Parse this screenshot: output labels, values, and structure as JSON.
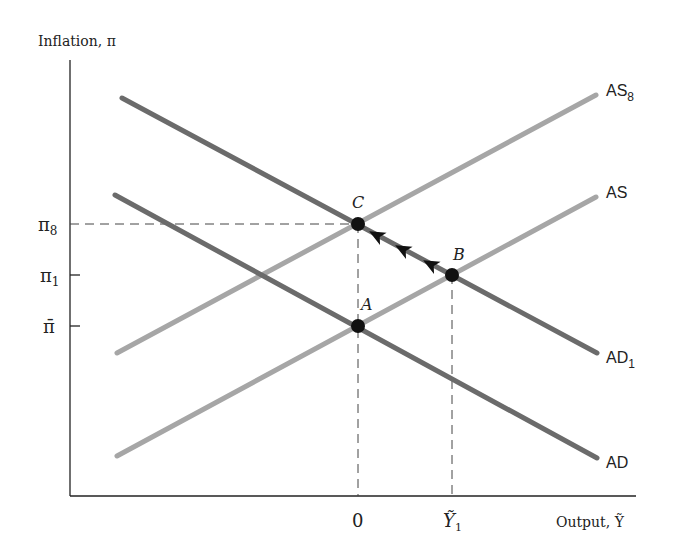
{
  "diagram": {
    "type": "AS-AD model",
    "y_axis": {
      "label": "Inflation, π"
    },
    "x_axis": {
      "label": "Output, Ỹ"
    },
    "y_ticks": [
      {
        "label": "π",
        "sub": "8",
        "y": 224
      },
      {
        "label": "π",
        "sub": "1",
        "y": 275
      },
      {
        "label": "π̄",
        "sub": "",
        "y": 326
      }
    ],
    "x_ticks": [
      {
        "label": "0",
        "x": 358
      },
      {
        "label": "Ỹ",
        "sub": "1",
        "x": 452
      }
    ],
    "curves": [
      {
        "name": "AS",
        "sub": "8",
        "kind": "supply",
        "color": "#a6a6a6",
        "x1": 117,
        "y1": 353,
        "x2": 596,
        "y2": 95
      },
      {
        "name": "AS",
        "sub": "",
        "kind": "supply",
        "color": "#a6a6a6",
        "x1": 117,
        "y1": 456,
        "x2": 596,
        "y2": 197
      },
      {
        "name": "AD",
        "sub": "1",
        "kind": "demand",
        "color": "#6b6b6b",
        "x1": 122,
        "y1": 98,
        "x2": 597,
        "y2": 353
      },
      {
        "name": "AD",
        "sub": "",
        "kind": "demand",
        "color": "#6b6b6b",
        "x1": 115,
        "y1": 195,
        "x2": 597,
        "y2": 458
      }
    ],
    "points": [
      {
        "label": "C",
        "x": 358,
        "y": 224
      },
      {
        "label": "B",
        "x": 452,
        "y": 275
      },
      {
        "label": "A",
        "x": 358,
        "y": 326
      }
    ],
    "arrows_path": {
      "from": "B",
      "to": "C",
      "count": 3
    }
  }
}
